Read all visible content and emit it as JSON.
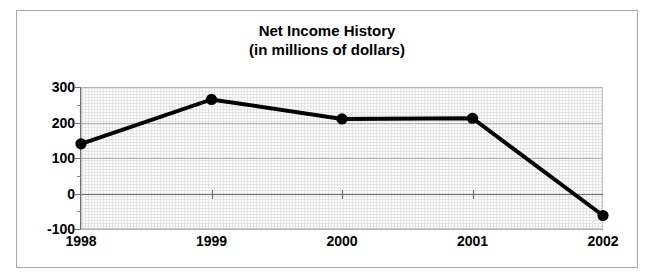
{
  "chart_data": {
    "type": "line",
    "title": "Net Income History",
    "subtitle": "(in millions of dollars)",
    "xlabel": "",
    "ylabel": "",
    "categories": [
      "1998",
      "1999",
      "2000",
      "2001",
      "2002"
    ],
    "values": [
      140,
      265,
      210,
      212,
      -62
    ],
    "series": [
      {
        "name": "Net Income",
        "values": [
          140,
          265,
          210,
          212,
          -62
        ]
      }
    ],
    "ylim": [
      -100,
      300
    ],
    "yticks": [
      300,
      200,
      100,
      0,
      -100
    ],
    "ytick_labels": [
      "300",
      "200",
      "100",
      "0",
      "-100"
    ],
    "minor_ticks": true,
    "minor_tick_step": 50,
    "grid": true,
    "grid_axis": "y",
    "legend": "none",
    "marker": "filled-circle",
    "line_color": "#000000",
    "marker_color": "#000000",
    "plot_background": "#f2f2f2",
    "figure_background": "#ffffff",
    "border_color": "#a8a8a8"
  }
}
